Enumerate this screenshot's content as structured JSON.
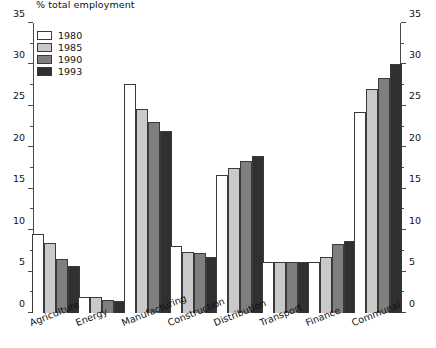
{
  "chart_data": {
    "type": "bar",
    "title": "% total employment",
    "xlabel": "",
    "ylabel": "% total employment",
    "ylim": [
      0,
      35
    ],
    "ytick_step": 5,
    "yminor_step": 2.5,
    "grid": false,
    "legend_position": "top-left",
    "dual_axis": true,
    "categories": [
      "Agriculture",
      "Energy",
      "Manufacturing",
      "Construction",
      "Distribution",
      "Transport",
      "Finance",
      "Communal"
    ],
    "yticks": [
      "0",
      "5",
      "10",
      "15",
      "20",
      "25",
      "30",
      "35"
    ],
    "series": [
      {
        "name": "1980",
        "color": "#ffffff",
        "values": [
          9.5,
          1.9,
          27.6,
          8.1,
          16.7,
          6.2,
          6.2,
          24.3
        ]
      },
      {
        "name": "1985",
        "color": "#c9c9c9",
        "values": [
          8.4,
          1.9,
          24.6,
          7.4,
          17.5,
          6.2,
          6.8,
          27.0
        ]
      },
      {
        "name": "1990",
        "color": "#7f7f7f",
        "values": [
          6.5,
          1.6,
          23.0,
          7.3,
          18.4,
          6.1,
          8.3,
          28.4
        ]
      },
      {
        "name": "1993",
        "color": "#303030",
        "values": [
          5.7,
          1.5,
          22.0,
          6.8,
          19.0,
          6.1,
          8.7,
          30.0
        ]
      }
    ]
  }
}
